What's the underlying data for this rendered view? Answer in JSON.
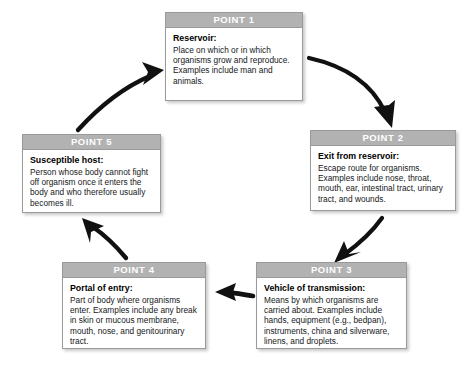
{
  "diagram": {
    "header_color": "#b2b2b2",
    "box_border_color": "#9a9a9a",
    "arrow_color": "#111111",
    "points": [
      {
        "id": "point-1",
        "header": "POINT 1",
        "title": "Reservoir:",
        "text": "Place on which or in which organisms grow and reproduce. Examples include man and animals."
      },
      {
        "id": "point-2",
        "header": "POINT 2",
        "title": "Exit from reservoir:",
        "text": "Escape route for organisms. Examples include nose, throat, mouth, ear, intestinal tract, urinary tract, and wounds."
      },
      {
        "id": "point-3",
        "header": "POINT 3",
        "title": "Vehicle of transmission:",
        "text": "Means by which organisms are carried about.  Examples include hands, equipment (e.g., bedpan), instruments, china and silverware, linens, and droplets."
      },
      {
        "id": "point-4",
        "header": "POINT 4",
        "title": "Portal of entry:",
        "text": "Part of body where organisms enter.  Examples include any break in skin or mucous membrane, mouth, nose, and genitourinary tract."
      },
      {
        "id": "point-5",
        "header": "POINT 5",
        "title": "Susceptible host:",
        "text": "Person whose body cannot fight off organism once it enters the body and who therefore usually becomes ill."
      }
    ],
    "arrows": [
      {
        "id": "arrow-1-to-2",
        "from": "point-1",
        "to": "point-2",
        "direction": "down-right"
      },
      {
        "id": "arrow-2-to-3",
        "from": "point-2",
        "to": "point-3",
        "direction": "down-left"
      },
      {
        "id": "arrow-3-to-4",
        "from": "point-3",
        "to": "point-4",
        "direction": "left"
      },
      {
        "id": "arrow-4-to-5",
        "from": "point-4",
        "to": "point-5",
        "direction": "up-left"
      },
      {
        "id": "arrow-5-to-1",
        "from": "point-5",
        "to": "point-1",
        "direction": "up-right"
      }
    ]
  }
}
